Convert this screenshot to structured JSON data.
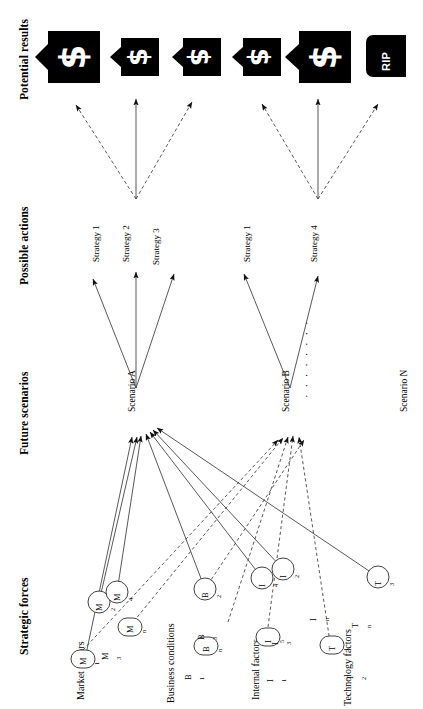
{
  "diagram": {
    "orientation": "rotated-90",
    "columns": [
      {
        "id": "potential-results",
        "label": "Potential results"
      },
      {
        "id": "possible-actions",
        "label": "Possible actions"
      },
      {
        "id": "future-scenarios",
        "label": "Future scenarios"
      },
      {
        "id": "strategic-forces",
        "label": "Strategic forces"
      }
    ],
    "results": [
      {
        "id": "result-1",
        "icon": "money-bag-flag-icon",
        "glyph": "$",
        "size": "large"
      },
      {
        "id": "result-2",
        "icon": "money-bag-flag-icon",
        "glyph": "$",
        "size": "small"
      },
      {
        "id": "result-3",
        "icon": "money-bag-flag-icon",
        "glyph": "$",
        "size": "small"
      },
      {
        "id": "result-4",
        "icon": "money-bag-flag-icon",
        "glyph": "$",
        "size": "small"
      },
      {
        "id": "result-5",
        "icon": "money-bag-flag-icon",
        "glyph": "$",
        "size": "large"
      },
      {
        "id": "result-6",
        "icon": "tombstone-icon",
        "glyph": "RIP",
        "size": "tomb"
      }
    ],
    "strategies": [
      {
        "id": "strategy-a1",
        "label": "Strategy 1",
        "scenario": "Scenario A"
      },
      {
        "id": "strategy-a2",
        "label": "Strategy 2",
        "scenario": "Scenario A"
      },
      {
        "id": "strategy-a3",
        "label": "Strategy 3",
        "scenario": "Scenario A"
      },
      {
        "id": "strategy-b1",
        "label": "Strategy 1",
        "scenario": "Scenario B"
      },
      {
        "id": "strategy-b4",
        "label": "Strategy 4",
        "scenario": "Scenario B"
      }
    ],
    "scenarios": [
      {
        "id": "scenario-a",
        "label": "Scenario A"
      },
      {
        "id": "scenario-b",
        "label": "Scenario B"
      },
      {
        "id": "scenario-n",
        "label": "Scenario N"
      }
    ],
    "ellipsis": "· · · · · · · ·",
    "force_groups": [
      {
        "id": "market-factors",
        "label": "Market factors"
      },
      {
        "id": "business-conditions",
        "label": "Business conditions"
      },
      {
        "id": "internal-factors",
        "label": "Internal factors"
      },
      {
        "id": "technology-factors",
        "label": "Technology factors"
      }
    ],
    "forces": [
      {
        "id": "M1",
        "base": "M",
        "sub": "1",
        "shape": "oval",
        "group": "market-factors"
      },
      {
        "id": "M2",
        "base": "M",
        "sub": "2",
        "shape": "circle",
        "group": "market-factors"
      },
      {
        "id": "M3",
        "base": "M",
        "sub": "3",
        "shape": "none",
        "group": "market-factors"
      },
      {
        "id": "M4",
        "base": "M",
        "sub": "4",
        "shape": "circle",
        "group": "market-factors"
      },
      {
        "id": "Mn",
        "base": "M",
        "sub": "n",
        "shape": "oval",
        "group": "market-factors"
      },
      {
        "id": "B1",
        "base": "B",
        "sub": "1",
        "shape": "none",
        "group": "business-conditions"
      },
      {
        "id": "B2",
        "base": "B",
        "sub": "2",
        "shape": "circle",
        "group": "business-conditions"
      },
      {
        "id": "B3",
        "base": "B",
        "sub": "3",
        "shape": "none",
        "group": "business-conditions"
      },
      {
        "id": "Bn",
        "base": "B",
        "sub": "n",
        "shape": "oval",
        "group": "business-conditions"
      },
      {
        "id": "I1",
        "base": "I",
        "sub": "1",
        "shape": "none",
        "group": "internal-factors"
      },
      {
        "id": "I2",
        "base": "I",
        "sub": "2",
        "shape": "circle",
        "group": "internal-factors"
      },
      {
        "id": "I3",
        "base": "I",
        "sub": "3",
        "shape": "none",
        "group": "internal-factors"
      },
      {
        "id": "I4",
        "base": "I",
        "sub": "4",
        "shape": "circle",
        "group": "internal-factors"
      },
      {
        "id": "I5",
        "base": "I",
        "sub": "5",
        "shape": "oval",
        "group": "internal-factors"
      },
      {
        "id": "In",
        "base": "I",
        "sub": "n",
        "shape": "none",
        "group": "internal-factors"
      },
      {
        "id": "T1",
        "base": "T",
        "sub": "1",
        "shape": "oval",
        "group": "technology-factors"
      },
      {
        "id": "T2",
        "base": "T",
        "sub": "2",
        "shape": "none",
        "group": "technology-factors"
      },
      {
        "id": "T3",
        "base": "T",
        "sub": "3",
        "shape": "circle",
        "group": "technology-factors"
      },
      {
        "id": "Tn",
        "base": "T",
        "sub": "n",
        "shape": "none",
        "group": "technology-factors"
      }
    ],
    "colors": {
      "ink": "#000000",
      "paper": "#ffffff",
      "line": "#3a3a3a"
    }
  }
}
